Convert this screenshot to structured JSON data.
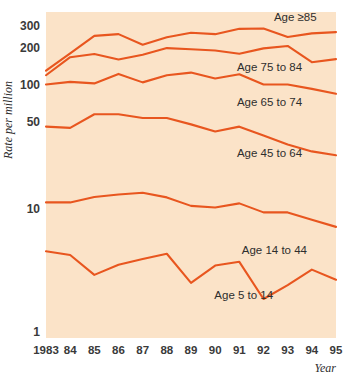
{
  "chart_data": {
    "type": "line",
    "title": "",
    "subtitle": "",
    "xlabel": "Year",
    "ylabel": "Rate per million",
    "yscale": "log",
    "ylim": [
      1,
      380
    ],
    "xlim": [
      1983,
      1995
    ],
    "grid": false,
    "legend_position": "inline-right",
    "background_color": "#fbe3c8",
    "line_color": "#e8561f",
    "x": [
      1983,
      1984,
      1985,
      1986,
      1987,
      1988,
      1989,
      1990,
      1991,
      1992,
      1993,
      1994,
      1995
    ],
    "xtick_labels": [
      "1983",
      "84",
      "85",
      "86",
      "87",
      "88",
      "89",
      "90",
      "91",
      "92",
      "93",
      "94",
      "95"
    ],
    "ytick_labels": [
      "300",
      "200",
      "100",
      "50",
      "10",
      "1"
    ],
    "ytick_values": [
      300,
      200,
      100,
      50,
      10,
      1
    ],
    "series": [
      {
        "name": "Age ≥85",
        "label": "Age ≥85",
        "label_x": 1994.2,
        "label_y": 330,
        "values": [
          131,
          180,
          250,
          258,
          212,
          244,
          265,
          258,
          285,
          287,
          245,
          262,
          268
        ]
      },
      {
        "name": "Age 75 to 84",
        "label": "Age 75 to 84",
        "label_x": 1993.6,
        "label_y": 130,
        "values": [
          120,
          168,
          178,
          161,
          176,
          199,
          195,
          190,
          179,
          198,
          207,
          153,
          162
        ]
      },
      {
        "name": "Age 65 to 74",
        "label": "Age 65 to 74",
        "label_x": 1993.6,
        "label_y": 68,
        "values": [
          101,
          106,
          103,
          123,
          105,
          120,
          126,
          113,
          122,
          101,
          101,
          93,
          85
        ]
      },
      {
        "name": "Age 45 to 64",
        "label": "Age 45 to 64",
        "label_x": 1993.6,
        "label_y": 26,
        "values": [
          46,
          45,
          58,
          58,
          54,
          54,
          48,
          42,
          46,
          39,
          33,
          29,
          27
        ]
      },
      {
        "name": "Age 14 to 44",
        "label": "Age 14 to 44",
        "label_x": 1993.8,
        "label_y": 4.3,
        "values": [
          11.2,
          11.2,
          12.4,
          13.0,
          13.4,
          12.3,
          10.5,
          10.2,
          11.0,
          9.3,
          9.3,
          8.1,
          7.1
        ]
      },
      {
        "name": "Age 5 to 14",
        "label": "Age 5 to 14",
        "label_x": 1992.4,
        "label_y": 1.85,
        "values": [
          4.5,
          4.2,
          2.9,
          3.5,
          3.9,
          4.3,
          2.5,
          3.45,
          3.7,
          1.85,
          2.4,
          3.2,
          2.65
        ]
      }
    ]
  }
}
